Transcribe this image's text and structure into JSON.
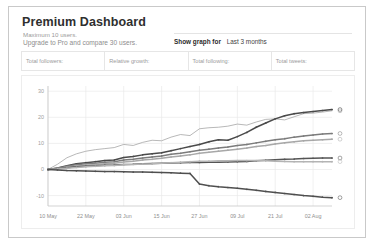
{
  "header": {
    "title": "Premium Dashboard",
    "subtitle_1": "Maximum 10 users.",
    "subtitle_2": "Upgrade to Pro and compare 30 users.",
    "show_graph_label": "Show graph for",
    "show_graph_value": "Last 3 months",
    "show_graph_options": [
      "Last 3 months"
    ]
  },
  "stats": [
    {
      "label": "Total followers:",
      "value": ""
    },
    {
      "label": "Relative growth:",
      "value": ""
    },
    {
      "label": "Total following:",
      "value": ""
    },
    {
      "label": "Total tweets:",
      "value": ""
    }
  ],
  "colors": {
    "page_border": "#c9c9c9",
    "title": "#2f2f2f",
    "muted_text": "#9a9a9a",
    "grid": "#e9e9e9",
    "axis": "#c8c8c8"
  },
  "chart_data": {
    "type": "line",
    "title": "",
    "xlabel": "",
    "ylabel": "",
    "grid": true,
    "legend": "none",
    "ylim": [
      -14,
      32
    ],
    "yticks": [
      30,
      20,
      10,
      0,
      -10
    ],
    "ytick_labels": [
      "30",
      "20",
      "10",
      "0",
      "-10"
    ],
    "xticks": [
      0,
      12,
      24,
      36,
      48,
      60,
      72,
      84
    ],
    "xtick_labels": [
      "10 May",
      "22 May",
      "03 Jun",
      "15 Jun",
      "27 Jun",
      "09 Jul",
      "21 Jul",
      "02 Aug"
    ],
    "xlim": [
      0,
      90
    ],
    "x": [
      0,
      3,
      6,
      9,
      12,
      15,
      18,
      21,
      24,
      27,
      30,
      33,
      36,
      39,
      42,
      45,
      48,
      51,
      54,
      57,
      60,
      63,
      66,
      69,
      72,
      75,
      78,
      81,
      84,
      87,
      90
    ],
    "series": [
      {
        "name": "series-1",
        "color": "#9a9a9a",
        "marker": "none",
        "endpoint_value": 22.5,
        "values": [
          0,
          2.0,
          4.5,
          6.0,
          7.0,
          7.6,
          8.0,
          8.4,
          9.6,
          9.2,
          10.4,
          11.2,
          11.0,
          12.4,
          13.4,
          13.0,
          15.6,
          16.0,
          16.2,
          16.6,
          17.4,
          17.0,
          18.2,
          19.2,
          19.4,
          19.0,
          20.2,
          21.4,
          21.6,
          22.0,
          22.5
        ]
      },
      {
        "name": "series-2",
        "color": "#4a4a4a",
        "marker": "dot",
        "endpoint_value": 23.0,
        "values": [
          0,
          0.6,
          1.4,
          2.2,
          2.6,
          3.0,
          3.4,
          3.6,
          4.6,
          5.0,
          5.6,
          6.0,
          6.4,
          7.2,
          8.0,
          8.8,
          9.6,
          10.6,
          11.4,
          11.2,
          12.6,
          14.2,
          16.2,
          17.8,
          19.4,
          20.6,
          21.4,
          21.8,
          22.2,
          22.6,
          23.0
        ]
      },
      {
        "name": "series-3",
        "color": "#7c7c7c",
        "marker": "dot",
        "endpoint_value": 13.8,
        "values": [
          0,
          0.5,
          1.2,
          1.8,
          2.2,
          2.4,
          2.8,
          3.0,
          3.6,
          3.9,
          4.4,
          4.8,
          5.2,
          5.8,
          6.2,
          6.8,
          7.4,
          7.8,
          8.2,
          8.6,
          9.2,
          9.6,
          10.2,
          10.8,
          11.4,
          11.8,
          12.4,
          12.8,
          13.2,
          13.6,
          13.8
        ]
      },
      {
        "name": "series-4",
        "color": "#a8a8a8",
        "marker": "dot",
        "endpoint_value": 11.6,
        "values": [
          0,
          0.4,
          0.9,
          1.3,
          1.6,
          1.9,
          2.2,
          2.4,
          2.9,
          3.2,
          3.6,
          3.9,
          4.3,
          4.8,
          5.2,
          5.6,
          6.2,
          6.6,
          7.0,
          7.4,
          7.8,
          8.2,
          8.8,
          9.2,
          9.8,
          10.2,
          10.6,
          11.0,
          11.2,
          11.4,
          11.6
        ]
      },
      {
        "name": "series-5",
        "color": "#555555",
        "marker": "dot",
        "endpoint_value": 4.4,
        "values": [
          0,
          0.3,
          0.7,
          1.0,
          1.2,
          1.4,
          1.6,
          1.7,
          1.9,
          2.0,
          2.2,
          2.3,
          2.4,
          2.5,
          2.6,
          2.7,
          2.7,
          2.8,
          2.8,
          2.9,
          3.0,
          3.1,
          3.3,
          3.5,
          3.7,
          3.9,
          4.0,
          4.2,
          4.3,
          4.4,
          4.4
        ]
      },
      {
        "name": "series-6",
        "color": "#b4b4b4",
        "marker": "dot",
        "endpoint_value": 3.0,
        "values": [
          0,
          0.2,
          0.5,
          0.8,
          1.0,
          1.2,
          1.4,
          1.5,
          1.8,
          1.9,
          2.1,
          2.2,
          2.4,
          2.6,
          2.8,
          3.0,
          3.2,
          3.2,
          3.3,
          3.3,
          3.4,
          3.4,
          3.4,
          3.3,
          3.2,
          3.1,
          3.0,
          3.0,
          3.0,
          3.0,
          3.0
        ]
      },
      {
        "name": "series-7",
        "color": "#4f4f4f",
        "marker": "dot",
        "endpoint_value": -10.8,
        "values": [
          0,
          -0.2,
          -0.4,
          -0.5,
          -0.6,
          -0.7,
          -0.8,
          -0.8,
          -0.9,
          -1.0,
          -1.0,
          -1.1,
          -1.2,
          -1.3,
          -1.4,
          -1.5,
          -5.6,
          -6.2,
          -6.6,
          -6.9,
          -7.2,
          -7.6,
          -8.0,
          -8.4,
          -8.8,
          -9.2,
          -9.6,
          -10.0,
          -10.3,
          -10.6,
          -10.8
        ]
      }
    ]
  }
}
